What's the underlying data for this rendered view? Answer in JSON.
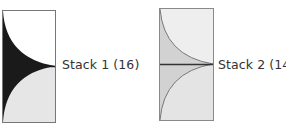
{
  "stacks": [
    {
      "label": "Stack 1 (16)",
      "name": "Stack 1",
      "count": 16,
      "colors": {
        "top": "#ffffff",
        "bottom": "#e6e6e6",
        "fill": "#1a1a1a",
        "border": "#777777",
        "midline": "#1a1a1a"
      }
    },
    {
      "label": "Stack 2 (14)",
      "name": "Stack 2",
      "count": 14,
      "colors": {
        "top": "#eeeeee",
        "bottom": "#e6e6e6",
        "fill": "#d2d2d2",
        "border": "#8a8a8a",
        "midline": "#333333"
      }
    }
  ]
}
